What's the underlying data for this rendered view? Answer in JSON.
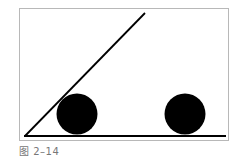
{
  "figure": {
    "caption": "图 2–14",
    "frame_color": "#b8b8b8",
    "line_color": "#000000",
    "ball_color": "#000000",
    "balls": [
      {
        "label": "ball-on-incline",
        "cx": 77,
        "cy": 114,
        "r": 20
      },
      {
        "label": "ball-on-ground",
        "cx": 185,
        "cy": 114,
        "r": 20
      }
    ]
  }
}
